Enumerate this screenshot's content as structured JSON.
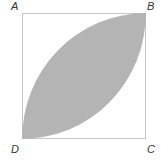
{
  "diagram": {
    "type": "geometry",
    "labels": {
      "A": "A",
      "B": "B",
      "C": "C",
      "D": "D"
    },
    "colors": {
      "square_stroke": "#c8c8c8",
      "shade_fill": "#b4b4b4",
      "label": "#333333"
    }
  }
}
